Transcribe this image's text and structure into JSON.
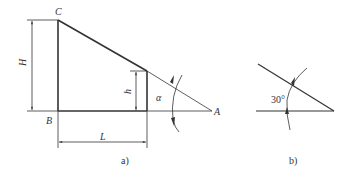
{
  "figure_a": {
    "caption": "a)",
    "points": {
      "C": "C",
      "B": "B",
      "A": "A"
    },
    "dimensions": {
      "H": "H",
      "h": "h",
      "L": "L"
    },
    "angle": "α"
  },
  "figure_b": {
    "caption": "b)",
    "angle": "30°"
  },
  "colors": {
    "line": "#333333",
    "background": "#ffffff"
  }
}
